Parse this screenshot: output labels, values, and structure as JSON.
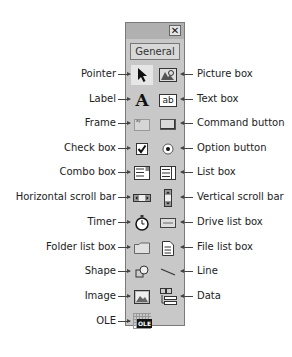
{
  "toolbox": {
    "close_glyph": "✕",
    "tab_label": "General"
  },
  "left_labels": [
    {
      "label": "Pointer",
      "icon": "pointer-icon"
    },
    {
      "label": "Label",
      "icon": "label-icon"
    },
    {
      "label": "Frame",
      "icon": "frame-icon"
    },
    {
      "label": "Check box",
      "icon": "checkbox-icon"
    },
    {
      "label": "Combo box",
      "icon": "combobox-icon"
    },
    {
      "label": "Horizontal scroll bar",
      "icon": "hscrollbar-icon"
    },
    {
      "label": "Timer",
      "icon": "timer-icon"
    },
    {
      "label": "Folder list box",
      "icon": "folder-list-icon"
    },
    {
      "label": "Shape",
      "icon": "shape-icon"
    },
    {
      "label": "Image",
      "icon": "image-icon"
    },
    {
      "label": "OLE",
      "icon": "ole-icon"
    }
  ],
  "right_labels": [
    {
      "label": "Picture box",
      "icon": "picturebox-icon"
    },
    {
      "label": "Text box",
      "icon": "textbox-icon"
    },
    {
      "label": "Command button",
      "icon": "command-button-icon"
    },
    {
      "label": "Option button",
      "icon": "option-button-icon"
    },
    {
      "label": "List box",
      "icon": "listbox-icon"
    },
    {
      "label": "Vertical scroll bar",
      "icon": "vscrollbar-icon"
    },
    {
      "label": "Drive list box",
      "icon": "drive-list-icon"
    },
    {
      "label": "File list box",
      "icon": "file-list-icon"
    },
    {
      "label": "Line",
      "icon": "line-icon"
    },
    {
      "label": "Data",
      "icon": "data-icon"
    }
  ],
  "icon_text": {
    "label_glyph": "A",
    "textbox_glyph": "ab",
    "ole_glyph": "OLE"
  }
}
